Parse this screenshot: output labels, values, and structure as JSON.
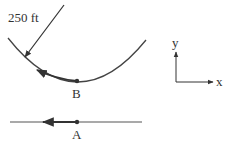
{
  "diagram": {
    "radius_label": "250 ft",
    "point_b_label": "B",
    "point_a_label": "A",
    "axis_y_label": "y",
    "axis_x_label": "x",
    "colors": {
      "stroke": "#333333",
      "background": "#ffffff"
    }
  }
}
